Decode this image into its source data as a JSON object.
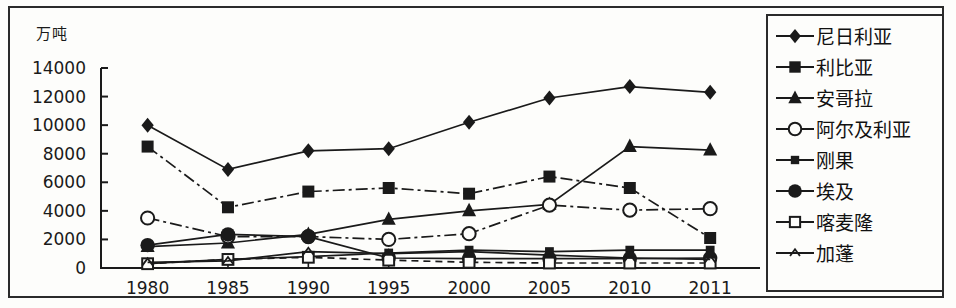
{
  "chart_data": {
    "type": "line",
    "title": "",
    "subtitle": "",
    "ylabel": "万吨",
    "xlabel": "",
    "ylim": [
      0,
      14000
    ],
    "ytick_values": [
      0,
      2000,
      4000,
      6000,
      8000,
      10000,
      12000,
      14000
    ],
    "ytick_labels": [
      "0",
      "2000",
      "4000",
      "6000",
      "8000",
      "10000",
      "12000",
      "14000"
    ],
    "grid": false,
    "legend_position": "right",
    "categories": [
      "1980",
      "1985",
      "1990",
      "1995",
      "2000",
      "2005",
      "2010",
      "2011"
    ],
    "series": [
      {
        "name": "尼日利亚",
        "marker": "filled-diamond",
        "line": "solid",
        "values": [
          10000,
          6900,
          8200,
          8350,
          10200,
          11900,
          12700,
          12300
        ]
      },
      {
        "name": "利比亚",
        "marker": "filled-square",
        "line": "dash-dot",
        "values": [
          8500,
          4250,
          5350,
          5600,
          5200,
          6400,
          5600,
          2100
        ]
      },
      {
        "name": "安哥拉",
        "marker": "filled-triangle",
        "line": "solid",
        "values": [
          1500,
          1750,
          2350,
          3400,
          4000,
          4450,
          8500,
          8250
        ]
      },
      {
        "name": "阿尔及利亚",
        "marker": "open-circle",
        "line": "dash-dot",
        "values": [
          3500,
          2200,
          2200,
          2000,
          2400,
          4400,
          4050,
          4150
        ]
      },
      {
        "name": "刚果",
        "marker": "small-square",
        "line": "solid",
        "values": [
          300,
          600,
          800,
          1050,
          1250,
          1150,
          1250,
          1250
        ]
      },
      {
        "name": "埃及",
        "marker": "filled-circle",
        "line": "solid",
        "values": [
          1600,
          2350,
          2200,
          700,
          650,
          650,
          650,
          700
        ]
      },
      {
        "name": "喀麦隆",
        "marker": "open-square",
        "line": "dash",
        "values": [
          300,
          600,
          750,
          550,
          400,
          350,
          350,
          350
        ]
      },
      {
        "name": "加蓬",
        "marker": "small-triangle",
        "line": "solid",
        "values": [
          400,
          500,
          1150,
          1000,
          1150,
          900,
          700,
          600
        ]
      }
    ]
  },
  "legend": {
    "items": [
      {
        "label": "尼日利亚"
      },
      {
        "label": "利比亚"
      },
      {
        "label": "安哥拉"
      },
      {
        "label": "阿尔及利亚"
      },
      {
        "label": "刚果"
      },
      {
        "label": "埃及"
      },
      {
        "label": "喀麦隆"
      },
      {
        "label": "加蓬"
      }
    ]
  },
  "colors": {
    "ink": "#1a1a1a",
    "background": "#fdfdfb",
    "frame": "#2b2b2b"
  }
}
